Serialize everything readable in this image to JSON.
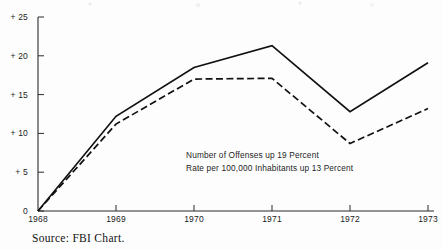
{
  "chart_data": {
    "type": "line",
    "title": "",
    "subtitle": "",
    "xlabel": "",
    "ylabel": "",
    "x": [
      "1968",
      "1969",
      "1970",
      "1971",
      "1972",
      "1973"
    ],
    "xlim": [
      1968,
      1973
    ],
    "ylim": [
      0,
      25
    ],
    "y_ticks": [
      "0",
      "+ 5",
      "+ 10",
      "+ 15",
      "+ 20",
      "+ 25"
    ],
    "y_tick_values": [
      0,
      5,
      10,
      15,
      20,
      25
    ],
    "x_ticks": [
      "1968",
      "1969",
      "1970",
      "1971",
      "1972",
      "1973"
    ],
    "grid": false,
    "legend": "none",
    "series": [
      {
        "name": "Number of Offenses",
        "style": "solid",
        "color": "#111111",
        "values": [
          0,
          12.2,
          18.5,
          21.3,
          12.8,
          19.1
        ]
      },
      {
        "name": "Rate per 100,000 Inhabitants",
        "style": "dashed",
        "color": "#111111",
        "values": [
          0,
          11.2,
          17.0,
          17.1,
          8.7,
          13.2
        ]
      }
    ],
    "annotations": [
      "Number of Offenses up 19 Percent",
      "Rate per 100,000 Inhabitants up 13 Percent"
    ]
  },
  "footer": {
    "source": "Source:  FBI  Chart."
  },
  "colors": {
    "axis": "#2b2b2b",
    "line": "#111111",
    "background": "#fdfdfd",
    "text": "#1a1a1a"
  }
}
